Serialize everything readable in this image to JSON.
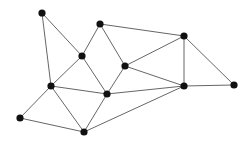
{
  "diagram": {
    "type": "undirected-graph",
    "width": 249,
    "height": 146,
    "background": "#ffffff",
    "node_color": "#111111",
    "edge_color": "#555555",
    "node_radius": 3.6,
    "edge_width": 0.9,
    "nodes": [
      {
        "id": "A",
        "x": 42,
        "y": 13
      },
      {
        "id": "B",
        "x": 100,
        "y": 24
      },
      {
        "id": "C",
        "x": 82,
        "y": 56
      },
      {
        "id": "D",
        "x": 184,
        "y": 36
      },
      {
        "id": "E",
        "x": 125,
        "y": 66
      },
      {
        "id": "F",
        "x": 51,
        "y": 86
      },
      {
        "id": "G",
        "x": 107,
        "y": 94
      },
      {
        "id": "H",
        "x": 184,
        "y": 86
      },
      {
        "id": "I",
        "x": 234,
        "y": 85
      },
      {
        "id": "J",
        "x": 20,
        "y": 118
      },
      {
        "id": "K",
        "x": 84,
        "y": 132
      }
    ],
    "edges": [
      [
        "A",
        "C"
      ],
      [
        "A",
        "F"
      ],
      [
        "B",
        "C"
      ],
      [
        "B",
        "E"
      ],
      [
        "B",
        "D"
      ],
      [
        "C",
        "F"
      ],
      [
        "C",
        "G"
      ],
      [
        "D",
        "E"
      ],
      [
        "D",
        "H"
      ],
      [
        "D",
        "I"
      ],
      [
        "E",
        "G"
      ],
      [
        "E",
        "H"
      ],
      [
        "F",
        "G"
      ],
      [
        "F",
        "J"
      ],
      [
        "F",
        "K"
      ],
      [
        "G",
        "K"
      ],
      [
        "G",
        "H"
      ],
      [
        "H",
        "I"
      ],
      [
        "J",
        "K"
      ],
      [
        "K",
        "H"
      ]
    ]
  }
}
